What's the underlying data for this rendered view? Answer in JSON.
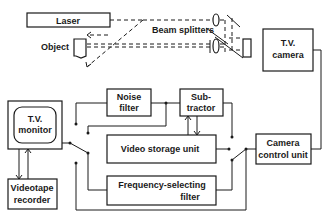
{
  "diagram": {
    "title": "",
    "nodes": {
      "laser": {
        "label": "Laser"
      },
      "object": {
        "label": "Object"
      },
      "beam_splitters": {
        "label": "Beam splitters"
      },
      "tv_camera": {
        "line1": "T.V.",
        "line2": "camera"
      },
      "tv_monitor": {
        "line1": "T.V.",
        "line2": "monitor"
      },
      "videotape_recorder": {
        "line1": "Videotape",
        "line2": "recorder"
      },
      "noise_filter": {
        "line1": "Noise",
        "line2": "filter"
      },
      "subtractor": {
        "line1": "Sub-",
        "line2": "tractor"
      },
      "video_storage_unit": {
        "label": "Video storage unit"
      },
      "frequency_selecting_filter": {
        "line1": "Frequency-selecting",
        "line2": "filter"
      },
      "camera_control_unit": {
        "line1": "Camera",
        "line2": "control unit"
      }
    },
    "edges": [
      {
        "from": "laser",
        "to": "beam_splitters",
        "style": "dashed"
      },
      {
        "from": "beam_splitters",
        "to": "object",
        "style": "dashed"
      },
      {
        "from": "object",
        "to": "tv_camera",
        "style": "dashed"
      },
      {
        "from": "beam_splitters",
        "to": "tv_camera",
        "style": "dashed"
      },
      {
        "from": "tv_camera",
        "to": "camera_control_unit",
        "style": "solid"
      },
      {
        "from": "camera_control_unit",
        "to": "switch_right",
        "style": "solid"
      },
      {
        "from": "noise_filter",
        "to": "subtractor",
        "style": "solid"
      },
      {
        "from": "video_storage_unit",
        "to": "subtractor",
        "style": "solid"
      },
      {
        "from": "subtractor",
        "to": "video_storage_unit",
        "style": "solid"
      },
      {
        "from": "switch_left",
        "to": "tv_monitor",
        "style": "solid"
      },
      {
        "from": "tv_monitor",
        "to": "videotape_recorder",
        "style": "solid"
      },
      {
        "from": "videotape_recorder",
        "to": "tv_monitor",
        "style": "solid"
      },
      {
        "from": "frequency_selecting_filter",
        "to": "switch_right",
        "style": "solid"
      }
    ]
  }
}
